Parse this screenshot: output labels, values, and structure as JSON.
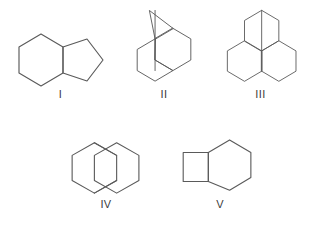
{
  "page": {
    "background_color": "#ffffff",
    "line_color": "#5a5a5a",
    "label_color": "#3c3c3c",
    "width": 319,
    "height": 234
  },
  "figure": {
    "type": "chemical-structure-set",
    "rows": [
      {
        "items": [
          "I",
          "II",
          "III"
        ]
      },
      {
        "items": [
          "IV",
          "V"
        ]
      }
    ]
  },
  "structures": [
    {
      "label": "I",
      "name": "fused-six-five-bicyclic",
      "description": "cyclohexane ring cis-fused to a cyclopentane ring sharing one edge",
      "ring_sizes": [
        6,
        5
      ],
      "fusion": "ortho-fused",
      "polygons": [
        {
          "name": "six-membered-ring",
          "points": "4,26 4,52 26,65 48,52 48,26 26,13"
        },
        {
          "name": "five-membered-ring",
          "points": "48,26 48,52 72,60 88,39 72,18"
        }
      ],
      "extra_bonds": []
    },
    {
      "label": "II",
      "name": "cyclopropane-fused-bicyclic",
      "description": "three-membered ring at the top apex fused onto a bridged six-membered ring system",
      "ring_sizes": [
        3,
        6,
        6
      ],
      "fusion": "bridged-with-cyclopropane",
      "polygons": [
        {
          "name": "six-membered-ring-right",
          "points": "23,36 23,62 45,75 67,62 67,36 45,23"
        },
        {
          "name": "six-membered-ring-left",
          "points": "23,36 1,49 1,75 23,88 45,75 23,62"
        },
        {
          "name": "cyclopropane-ring",
          "points": "23,36 16,1 45,23"
        }
      ],
      "extra_bonds": [
        {
          "name": "vertical-bridge-bond",
          "x1": 23,
          "y1": 1,
          "x2": 23,
          "y2": 75
        }
      ]
    },
    {
      "label": "III",
      "name": "overlapping-fused-bicyclic",
      "description": "two six-membered rings drawn overlapping and joined through a shared vertical bond",
      "ring_sizes": [
        6,
        6
      ],
      "fusion": "spiro-overlap",
      "polygons": [
        {
          "name": "six-membered-ring-upper",
          "points": "23,36 23,10 45,-3 67,10 67,36 45,49"
        },
        {
          "name": "six-membered-ring-lower-right",
          "points": "45,49 67,36 89,49 89,75 67,88 45,75"
        },
        {
          "name": "six-membered-ring-lower-left",
          "points": "45,49 23,36 1,49 1,75 23,88 45,75"
        }
      ],
      "extra_bonds": [
        {
          "name": "vertical-shared-bond",
          "x1": 45,
          "y1": -3,
          "x2": 45,
          "y2": 75
        }
      ]
    },
    {
      "label": "IV",
      "name": "bridged-bicyclooctane",
      "description": "two six-membered rings sharing a zig-zag two-atom bridge drawn as overlapping hexagons",
      "ring_sizes": [
        6,
        6
      ],
      "fusion": "bridged",
      "polygons": [
        {
          "name": "hexagon-left",
          "points": "24,4 1,17 1,43 24,56 47,43 47,17"
        },
        {
          "name": "hexagon-right",
          "points": "47,4 70,17 70,43 47,56 24,43 24,17"
        }
      ],
      "extra_bonds": [
        {
          "name": "bridge-bond-upper",
          "x1": 24,
          "y1": 4,
          "x2": 47,
          "y2": 17
        },
        {
          "name": "bridge-bond-lower",
          "x1": 24,
          "y1": 56,
          "x2": 47,
          "y2": 43
        }
      ]
    },
    {
      "label": "V",
      "name": "bicyclo-four-two-zero-octane",
      "description": "cyclobutane ring fused to a cyclohexane ring along a shared vertical edge",
      "ring_sizes": [
        4,
        6
      ],
      "fusion": "ortho-fused",
      "polygons": [
        {
          "name": "cyclobutane-ring",
          "points": "2,11 28,11 28,41 2,41"
        },
        {
          "name": "six-membered-ring",
          "points": "28,11 50,-2 72,11 72,37 50,50 28,41"
        }
      ],
      "extra_bonds": []
    }
  ],
  "labels": {
    "I": "I",
    "II": "II",
    "III": "III",
    "IV": "IV",
    "V": "V"
  }
}
